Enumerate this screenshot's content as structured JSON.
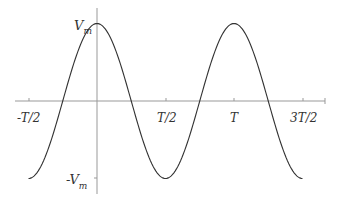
{
  "chart_data": {
    "type": "line",
    "title": "",
    "xlabel": "",
    "ylabel": "",
    "function": "V_m cos(2*pi*t/T)",
    "x_ticks": [
      "-T/2",
      "T/2",
      "T",
      "3T/2"
    ],
    "y_ticks": [
      "V_m",
      "-V_m"
    ],
    "x_range_in_T": [
      -0.5,
      1.5
    ],
    "y_range": [
      -1,
      1
    ],
    "series": [
      {
        "name": "v(t)",
        "x": [
          -0.5,
          -0.25,
          0,
          0.25,
          0.5,
          0.75,
          1.0,
          1.25,
          1.5
        ],
        "values": [
          -1,
          0,
          1,
          0,
          -1,
          0,
          1,
          0,
          -1
        ]
      }
    ],
    "grid": false,
    "colors": {
      "axis": "#999999",
      "curve": "#333333"
    }
  },
  "labels": {
    "vm_main": "V",
    "vm_sub": "m",
    "neg_vm_main": "-V",
    "neg_vm_sub": "m",
    "x_neg_half": "-T/2",
    "x_half": "T/2",
    "x_T": "T",
    "x_three_half": "3T/2"
  }
}
